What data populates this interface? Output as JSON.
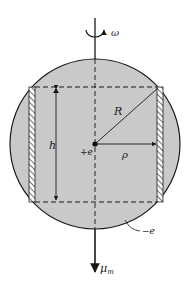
{
  "figure": {
    "labels": {
      "omega": "ω",
      "R": "R",
      "h": "h",
      "plus_e": "+e",
      "rho": "ρ",
      "minus_e": "−e",
      "mu": "μ",
      "mu_sub": "m"
    },
    "colors": {
      "sphere_fill": "#c9c9c9",
      "line": "#1a1a1a",
      "background": "#ffffff"
    }
  }
}
